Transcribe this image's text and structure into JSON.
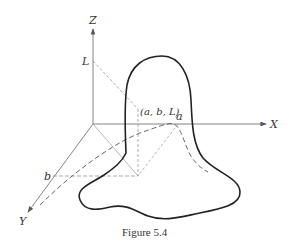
{
  "figure": {
    "caption": "Figure 5.4",
    "axes": {
      "x_label": "X",
      "y_label": "Y",
      "z_label": "Z"
    },
    "points": {
      "L_label": "L",
      "b_label": "b",
      "a_label": "a",
      "point_label": "(a, b, L)"
    },
    "colors": {
      "line": "#333333",
      "thin": "#666666"
    }
  }
}
